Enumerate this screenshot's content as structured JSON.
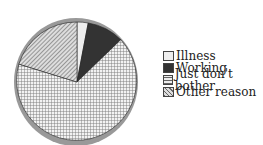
{
  "chart_data": {
    "type": "pie",
    "title": "",
    "categories": [
      "Illness",
      "Working",
      "Just don't bother",
      "Other reason"
    ],
    "values": [
      3,
      10,
      66,
      21
    ],
    "legend_position": "right",
    "styles": [
      "light-gray",
      "dark-solid",
      "crosshatch",
      "diagonal-hatch"
    ]
  },
  "legend": {
    "items": [
      {
        "label": "Illness"
      },
      {
        "label": "Working"
      },
      {
        "label": "Just don't bother"
      },
      {
        "label": "Other reason"
      }
    ]
  }
}
